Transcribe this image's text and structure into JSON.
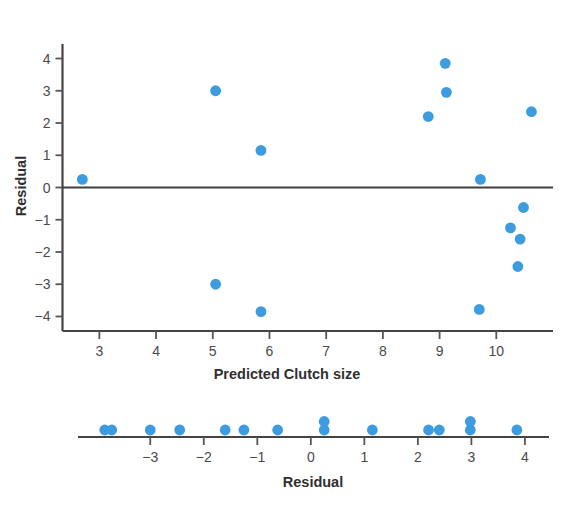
{
  "figure": {
    "title": "",
    "dot_color": "#3d9be0",
    "axis_color": "#444444"
  },
  "chart_data": [
    {
      "type": "scatter",
      "name": "residual-vs-predicted",
      "title": "",
      "xlabel": "Predicted Clutch size",
      "ylabel": "Residual",
      "xlim": [
        2.35,
        11.0
      ],
      "ylim": [
        -4.45,
        4.45
      ],
      "xticks": [
        3,
        4,
        5,
        6,
        7,
        8,
        9,
        10
      ],
      "yticks": [
        4,
        3,
        2,
        1,
        0,
        -1,
        -2,
        -3,
        -4
      ],
      "xticklabels": [
        "3",
        "4",
        "5",
        "6",
        "7",
        "8",
        "9",
        "10"
      ],
      "yticklabels": [
        "4",
        "3",
        "2",
        "1",
        "0",
        "−1",
        "−2",
        "−3",
        "−4"
      ],
      "grid": false,
      "legend": "none",
      "reference_line": {
        "orientation": "horizontal",
        "y": 0
      },
      "points": [
        {
          "x": 2.7,
          "y": 0.25
        },
        {
          "x": 5.05,
          "y": 3.0
        },
        {
          "x": 5.85,
          "y": 1.15
        },
        {
          "x": 5.05,
          "y": -3.0
        },
        {
          "x": 5.85,
          "y": -3.85
        },
        {
          "x": 8.8,
          "y": 2.2
        },
        {
          "x": 9.1,
          "y": 3.85
        },
        {
          "x": 9.12,
          "y": 2.95
        },
        {
          "x": 9.72,
          "y": 0.25
        },
        {
          "x": 9.7,
          "y": -3.78
        },
        {
          "x": 10.25,
          "y": -1.25
        },
        {
          "x": 10.42,
          "y": -1.6
        },
        {
          "x": 10.48,
          "y": -0.62
        },
        {
          "x": 10.38,
          "y": -2.45
        },
        {
          "x": 10.62,
          "y": 2.35
        }
      ]
    },
    {
      "type": "dotplot",
      "name": "residual-dotplot",
      "title": "",
      "xlabel": "Residual",
      "xlim": [
        -4.35,
        4.45
      ],
      "xticks": [
        -3,
        -2,
        -1,
        0,
        1,
        2,
        3,
        4
      ],
      "xticklabels": [
        "−3",
        "−2",
        "−1",
        "0",
        "1",
        "2",
        "3",
        "4"
      ],
      "grid": false,
      "legend": "none",
      "values": [
        -3.85,
        -3.75,
        -3.0,
        -2.45,
        -1.6,
        -1.25,
        -0.62,
        0.25,
        0.25,
        1.15,
        2.2,
        2.35,
        2.95,
        3.0,
        3.85
      ],
      "stacks": [
        {
          "x": -3.85,
          "count": 1,
          "level": 0
        },
        {
          "x": -3.72,
          "count": 1,
          "level": 0
        },
        {
          "x": -3.0,
          "count": 1,
          "level": 0
        },
        {
          "x": -2.45,
          "count": 1,
          "level": 0
        },
        {
          "x": -1.6,
          "count": 1,
          "level": 0
        },
        {
          "x": -1.25,
          "count": 1,
          "level": 0
        },
        {
          "x": -0.62,
          "count": 1,
          "level": 0
        },
        {
          "x": 0.25,
          "count": 2,
          "level": 0
        },
        {
          "x": 1.15,
          "count": 1,
          "level": 0
        },
        {
          "x": 2.2,
          "count": 1,
          "level": 0
        },
        {
          "x": 2.4,
          "count": 1,
          "level": 0
        },
        {
          "x": 2.98,
          "count": 2,
          "level": 0
        },
        {
          "x": 3.85,
          "count": 1,
          "level": 0
        }
      ]
    }
  ]
}
